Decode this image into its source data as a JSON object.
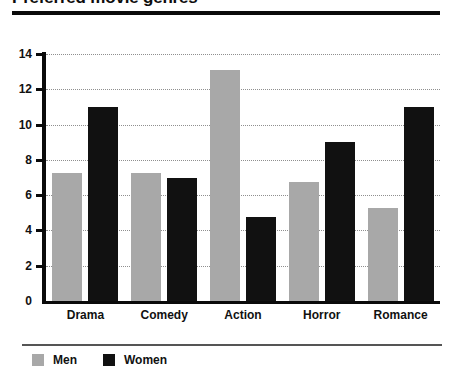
{
  "title": "Preferred movie genres",
  "legend": {
    "position": "bottom-left",
    "entries": [
      {
        "label": "Men",
        "color": "#a8a8a8"
      },
      {
        "label": "Women",
        "color": "#111111"
      }
    ]
  },
  "axes": {
    "y_ticks": [
      "0",
      "2",
      "4",
      "6",
      "8",
      "10",
      "12",
      "14"
    ]
  },
  "chart_data": {
    "type": "bar",
    "title": "Preferred movie genres",
    "xlabel": "",
    "ylabel": "",
    "categories": [
      "Drama",
      "Comedy",
      "Action",
      "Horror",
      "Romance"
    ],
    "series": [
      {
        "name": "Men",
        "color": "#a8a8a8",
        "values": [
          7.25,
          7.25,
          13.1,
          6.75,
          5.3
        ]
      },
      {
        "name": "Women",
        "color": "#111111",
        "values": [
          11.0,
          7.0,
          4.75,
          9.0,
          11.0
        ]
      }
    ],
    "ylim": [
      0,
      14
    ],
    "ytick_step": 2,
    "grid": "horizontal-dotted",
    "legend_position": "bottom-left"
  }
}
